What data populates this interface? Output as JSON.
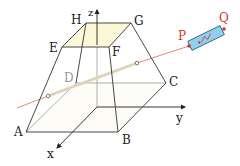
{
  "figure": {
    "type": "frustum-with-laser",
    "colors": {
      "edge": "#333333",
      "hidden_edge": "#9a9a9a",
      "top_face": "#fbf8d8",
      "beam_outside": "#e07a6a",
      "beam_inside": "#e6dcc4",
      "laser_body": "#8fd0ef",
      "laser_outline": "#2a5a7a",
      "point_red": "#d9342b"
    },
    "vertices": {
      "A": "A",
      "B": "B",
      "C": "C",
      "D": "D",
      "E": "E",
      "F": "F",
      "G": "G",
      "H": "H"
    },
    "axes": {
      "x": "x",
      "y": "y",
      "z": "z"
    },
    "laser_points": {
      "P": "P",
      "Q": "Q"
    }
  }
}
